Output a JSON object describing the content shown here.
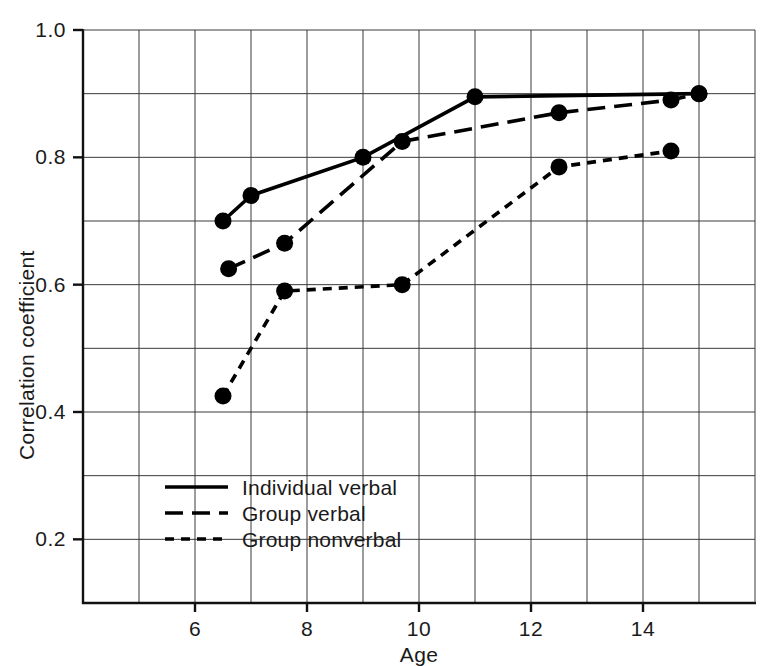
{
  "chart_data": {
    "type": "line",
    "title": "",
    "xlabel": "Age",
    "ylabel": "Correlation coefficient",
    "xlim": [
      4,
      16
    ],
    "ylim": [
      0.1,
      1.0
    ],
    "xticks": [
      6,
      8,
      10,
      12,
      14
    ],
    "xtick_labels": [
      "6",
      "8",
      "10",
      "12",
      "14"
    ],
    "yticks": [
      0.2,
      0.4,
      0.6,
      0.8,
      1.0
    ],
    "ytick_labels": [
      "0.2",
      "0.4",
      "0.6",
      "0.8",
      "1.0"
    ],
    "x_minor_step": 1,
    "y_minor_step": 0.1,
    "grid": true,
    "legend_position": "lower-left-inside",
    "series": [
      {
        "name": "Individual verbal",
        "style": "solid",
        "dash": "none",
        "color": "#000000",
        "points": [
          {
            "x": 6.5,
            "y": 0.7
          },
          {
            "x": 7.0,
            "y": 0.74
          },
          {
            "x": 9.0,
            "y": 0.8
          },
          {
            "x": 11.0,
            "y": 0.895
          },
          {
            "x": 15.0,
            "y": 0.9
          }
        ]
      },
      {
        "name": "Group verbal",
        "style": "long-dash",
        "dash": "18 9",
        "color": "#000000",
        "points": [
          {
            "x": 6.6,
            "y": 0.625
          },
          {
            "x": 7.6,
            "y": 0.665
          },
          {
            "x": 9.7,
            "y": 0.825
          },
          {
            "x": 12.5,
            "y": 0.87
          },
          {
            "x": 14.5,
            "y": 0.89
          },
          {
            "x": 15.0,
            "y": 0.9
          }
        ]
      },
      {
        "name": "Group nonverbal",
        "style": "short-dash",
        "dash": "9 7",
        "color": "#000000",
        "points": [
          {
            "x": 6.5,
            "y": 0.425
          },
          {
            "x": 7.6,
            "y": 0.59
          },
          {
            "x": 9.7,
            "y": 0.6
          },
          {
            "x": 12.5,
            "y": 0.785
          },
          {
            "x": 14.5,
            "y": 0.81
          }
        ]
      }
    ],
    "legend": [
      {
        "label": "Individual verbal",
        "style": "solid"
      },
      {
        "label": "Group verbal",
        "style": "long-dash"
      },
      {
        "label": "Group nonverbal",
        "style": "short-dash"
      }
    ]
  }
}
